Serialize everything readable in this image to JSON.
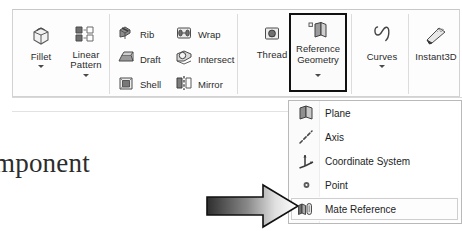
{
  "application": {
    "name": "SolidWorks Features Ribbon",
    "ribbon_tab": "Features"
  },
  "ribbon": {
    "big_buttons": [
      {
        "id": "fillet",
        "label": "Fillet",
        "label2": "",
        "icon": "fillet-icon",
        "has_dropdown": true
      },
      {
        "id": "linear-pattern",
        "label": "Linear",
        "label2": "Pattern",
        "icon": "linear-pattern-icon",
        "has_dropdown": true
      },
      {
        "id": "thread",
        "label": "Thread",
        "label2": "",
        "icon": "thread-icon",
        "has_dropdown": false
      },
      {
        "id": "reference-geometry",
        "label": "Reference",
        "label2": "Geometry",
        "icon": "reference-geometry-icon",
        "has_dropdown": true,
        "highlighted": true
      },
      {
        "id": "curves",
        "label": "Curves",
        "label2": "",
        "icon": "curves-icon",
        "has_dropdown": true
      },
      {
        "id": "instant3d",
        "label": "Instant3D",
        "label2": "",
        "icon": "instant3d-icon",
        "has_dropdown": false
      }
    ],
    "small_buttons": [
      {
        "id": "rib",
        "label": "Rib",
        "icon": "rib-icon"
      },
      {
        "id": "draft",
        "label": "Draft",
        "icon": "draft-icon"
      },
      {
        "id": "shell",
        "label": "Shell",
        "icon": "shell-icon"
      },
      {
        "id": "wrap",
        "label": "Wrap",
        "icon": "wrap-icon"
      },
      {
        "id": "intersect",
        "label": "Intersect",
        "icon": "intersect-icon"
      },
      {
        "id": "mirror",
        "label": "Mirror",
        "icon": "mirror-icon"
      }
    ]
  },
  "dropdown_menu": {
    "owner": "Reference Geometry",
    "items": [
      {
        "id": "plane",
        "label": "Plane",
        "icon": "plane-icon",
        "selected": false
      },
      {
        "id": "axis",
        "label": "Axis",
        "icon": "axis-icon",
        "selected": false
      },
      {
        "id": "coordinate-system",
        "label": "Coordinate System",
        "icon": "coordinate-system-icon",
        "selected": false
      },
      {
        "id": "point",
        "label": "Point",
        "icon": "point-icon",
        "selected": false
      },
      {
        "id": "mate-reference",
        "label": "Mate Reference",
        "icon": "mate-reference-icon",
        "selected": true
      }
    ]
  },
  "annotation": {
    "body_text": "mponent",
    "arrow": {
      "name": "gradient-pointer-arrow",
      "direction": "right",
      "points_to": "Mate Reference",
      "gradient_from": "#2e2e2e",
      "gradient_to": "#ffffff",
      "outline": "#111111"
    }
  },
  "colors": {
    "ribbon_background": "#fdfdfd",
    "ribbon_border": "#d2d2d2",
    "text": "#2b2b2b",
    "highlight_border": "#111111",
    "menu_background": "#ffffff",
    "menu_border": "#b9b9b9"
  }
}
